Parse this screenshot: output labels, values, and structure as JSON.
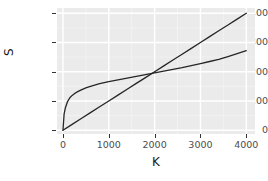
{
  "chart_data": {
    "type": "line",
    "title": "",
    "subtitle": "",
    "xlabel": "K",
    "ylabel": "S",
    "xlim": [
      -130,
      4190
    ],
    "ylim": [
      -13,
      418
    ],
    "xticks": [
      0,
      1000,
      2000,
      3000,
      4000
    ],
    "xtick_labels": [
      "0",
      "1000",
      "2000",
      "3000",
      "4000"
    ],
    "yticks": [
      0,
      100,
      200,
      300,
      400
    ],
    "ytick_labels": [
      "0",
      "100",
      "200",
      "300",
      "400"
    ],
    "grid": true,
    "grid_major_color": "#FFFFFF",
    "grid_minor_color": "#F5F5F5",
    "panel_background": "#EBEBEB",
    "figure_background": "#FFFFFF",
    "legend": "none",
    "legend_position": "none",
    "line_color": "#262626",
    "line_width": 1.3,
    "x_minor_ticks": [
      500,
      1500,
      2500,
      3500
    ],
    "y_minor_ticks": [
      50,
      150,
      250,
      350
    ],
    "annotations": [],
    "series": [
      {
        "name": "linear",
        "shape": "straight line through origin, slope 0.1",
        "x": [
          0,
          200,
          400,
          600,
          800,
          1000,
          1200,
          1400,
          1600,
          1800,
          2000,
          2200,
          2400,
          2600,
          2800,
          3000,
          3200,
          3400,
          3600,
          3800,
          4000
        ],
        "values": [
          0,
          20,
          40,
          60,
          80,
          100,
          120,
          140,
          160,
          180,
          200,
          220,
          240,
          260,
          280,
          300,
          320,
          340,
          360,
          380,
          400
        ]
      },
      {
        "name": "concave",
        "shape": "steep logarithmic-like rise from origin, flattening toward the right",
        "x": [
          0,
          25,
          50,
          100,
          150,
          200,
          250,
          300,
          400,
          500,
          600,
          800,
          1000,
          1200,
          1400,
          1600,
          1800,
          2000,
          2200,
          2400,
          2600,
          2800,
          3000,
          3200,
          3400,
          3600,
          3800,
          4000
        ],
        "values": [
          0,
          55,
          75,
          98,
          111,
          119,
          125,
          130,
          138,
          145,
          150,
          159,
          166,
          172,
          178,
          184,
          190,
          196,
          202,
          208,
          214,
          221,
          228,
          235,
          242,
          252,
          262,
          272
        ]
      }
    ],
    "crossing_point": {
      "x": 2200,
      "y": 220
    }
  }
}
